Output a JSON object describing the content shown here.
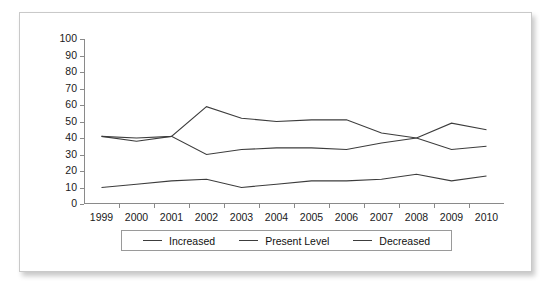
{
  "chart_data": {
    "type": "line",
    "title": "",
    "xlabel": "",
    "ylabel": "",
    "categories": [
      "1999",
      "2000",
      "2001",
      "2002",
      "2003",
      "2004",
      "2005",
      "2006",
      "2007",
      "2008",
      "2009",
      "2010"
    ],
    "ylim": [
      0,
      100
    ],
    "y_ticks": [
      100,
      90,
      80,
      70,
      60,
      50,
      40,
      30,
      20,
      10,
      0
    ],
    "grid": false,
    "legend_position": "bottom",
    "series": [
      {
        "name": "Increased",
        "values": [
          10,
          12,
          14,
          15,
          10,
          12,
          14,
          14,
          15,
          18,
          14,
          17
        ]
      },
      {
        "name": "Present Level",
        "values": [
          41,
          40,
          41,
          59,
          52,
          50,
          51,
          51,
          43,
          40,
          33,
          35
        ]
      },
      {
        "name": "Decreased",
        "values": [
          41,
          38,
          41,
          30,
          33,
          34,
          34,
          33,
          37,
          40,
          49,
          45
        ]
      }
    ],
    "series_color": "#3c3c3c",
    "axis_color": "#8a8a8a"
  },
  "legend": {
    "items": [
      {
        "label": "Increased"
      },
      {
        "label": "Present Level"
      },
      {
        "label": "Decreased"
      }
    ]
  }
}
